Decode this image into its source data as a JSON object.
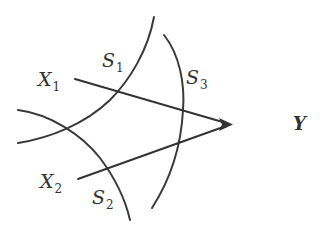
{
  "diagram": {
    "type": "convergence-diagram",
    "colors": {
      "stroke": "#3a3a3a",
      "text": "#333333",
      "background": "#ffffff"
    },
    "labels": {
      "x1": {
        "main": "X",
        "sub": "1"
      },
      "x2": {
        "main": "X",
        "sub": "2"
      },
      "s1": {
        "main": "S",
        "sub": "1"
      },
      "s2": {
        "main": "S",
        "sub": "2"
      },
      "s3": {
        "main": "S",
        "sub": "3"
      },
      "y": {
        "main": "Y"
      }
    },
    "rays": [
      {
        "from": "X1",
        "to": "Y"
      },
      {
        "from": "X2",
        "to": "Y"
      }
    ],
    "curves": [
      "S1",
      "S2",
      "S3"
    ]
  }
}
